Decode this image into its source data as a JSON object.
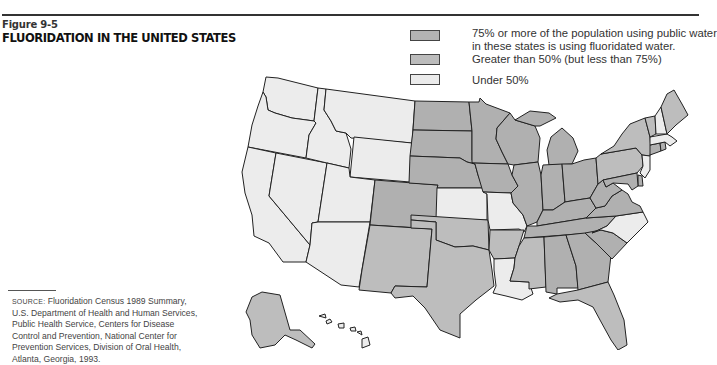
{
  "figure": {
    "label": "Figure 9-5",
    "title": "FLUORIDATION IN THE UNITED STATES"
  },
  "legend": {
    "items": [
      {
        "category": "high",
        "label_line1": "75% or more of the population using public water",
        "label_line2": "in these states is using fluoridated water.",
        "color": "#b3b3b3"
      },
      {
        "category": "mid",
        "label_line1": "Greater than 50% (but less than 75%)",
        "color": "#bcbcbc"
      },
      {
        "category": "low",
        "label_line1": "Under 50%",
        "color": "#ebebeb"
      }
    ]
  },
  "source": {
    "label": "SOURCE:",
    "text": "Fluoridation Census 1989 Summary, U.S. Department of Health and Human Services, Public Health Service, Centers for Disease Control and Prevention, National Center for Prevention Services, Division of Oral Health, Atlanta, Georgia, 1993."
  },
  "map": {
    "colors": {
      "high": "#b0b0b0",
      "mid": "#bdbdbd",
      "low": "#ececec",
      "stroke": "#222222"
    },
    "states": {
      "WA": "low",
      "OR": "low",
      "CA": "low",
      "NV": "low",
      "ID": "low",
      "MT": "low",
      "WY": "low",
      "UT": "low",
      "AZ": "low",
      "CO": "high",
      "NM": "mid",
      "ND": "high",
      "SD": "high",
      "NE": "high",
      "KS": "low",
      "OK": "mid",
      "TX": "mid",
      "MN": "high",
      "IA": "high",
      "MO": "low",
      "AR": "mid",
      "LA": "low",
      "WI": "high",
      "IL": "high",
      "MI": "high",
      "IN": "high",
      "OH": "high",
      "KY": "high",
      "TN": "high",
      "MS": "mid",
      "AL": "high",
      "GA": "high",
      "FL": "mid",
      "SC": "high",
      "NC": "low",
      "VA": "high",
      "WV": "high",
      "PA": "mid",
      "NY": "mid",
      "NJ": "low",
      "DE": "high",
      "MD": "high",
      "CT": "high",
      "RI": "high",
      "MA": "low",
      "VT": "mid",
      "NH": "low",
      "ME": "mid",
      "AK": "mid",
      "HI": "low",
      "DC": "high"
    }
  }
}
